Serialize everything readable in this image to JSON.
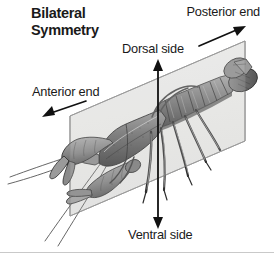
{
  "figure": {
    "title_line1": "Bilateral",
    "title_line2": "Symmetry",
    "background_color": "#ffffff",
    "text_color": "#1a1a1a"
  },
  "labels": {
    "posterior": "Posterior end",
    "dorsal": "Dorsal side",
    "anterior": "Anterior end",
    "ventral": "Ventral side"
  },
  "plane": {
    "name": "sagittal-plane",
    "fill_color": "#e8e8e6",
    "stroke_color": "#8c8c8c"
  },
  "arrows": {
    "posterior_arrow": "arrow-up-right",
    "dorsal_ventral_arrow": "arrow-double-vertical",
    "anterior_arrow": "arrow-down-left"
  },
  "organism": {
    "body_color": "#6e6e6e",
    "outline_color": "#2b2b2b",
    "shade_light": "#b9b9b9",
    "shade_mid": "#8a8a8a",
    "shade_dark": "#4a4a4a"
  }
}
